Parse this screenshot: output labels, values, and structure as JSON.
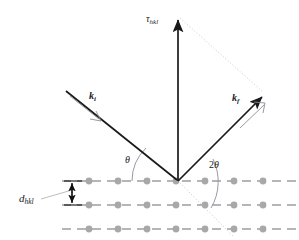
{
  "figure": {
    "kind": "bragg-diffraction-scattering-geometry",
    "background_color": "#ffffff",
    "width": 299,
    "height": 240
  },
  "colors": {
    "vector_stroke": "#1a1a1a",
    "lattice_dash": "#6b6b78",
    "atom_fill": "#a8a8a8",
    "construction_dotted": "#c9c9c9",
    "arc_stroke": "#9a9aa2",
    "label_text": "#1a1a1a",
    "open_arrowhead": "#8c8c94"
  },
  "labels": {
    "tau": {
      "symbol": "τ",
      "subscript": "hkl",
      "text": "τhkl"
    },
    "k_incident": {
      "symbol": "k",
      "subscript": "i",
      "text": "ki"
    },
    "k_final": {
      "symbol": "k",
      "subscript": "f",
      "text": "kf"
    },
    "d_spacing": {
      "symbol": "d",
      "subscript": "hkl",
      "text": "dhkl"
    },
    "angle_theta": {
      "prefix": "",
      "symbol": "θ",
      "text": "θ"
    },
    "angle_two_theta": {
      "prefix": "2",
      "symbol": "θ",
      "text": "2θ"
    }
  },
  "geometry": {
    "origin": {
      "x": 178,
      "y": 181
    },
    "tau_tip": {
      "x": 178,
      "y": 16
    },
    "k_i_start": {
      "x": 66,
      "y": 91
    },
    "k_f_tip": {
      "x": 265,
      "y": 93
    },
    "lattice_rows_y": [
      181,
      205,
      229
    ],
    "atom_spacing": 29,
    "atom_radius": 3.4,
    "atom_first_x": 89,
    "atoms_per_row": 8,
    "d_arrow_x": 72,
    "theta_arc_radius": 46,
    "two_theta_arc_radius": 52
  },
  "annotations": {
    "theta_description": "incidence angle between k-incident and lattice plane",
    "two_theta_description": "scattering angle between transmitted direction and k-final",
    "d_description": "interplanar spacing between adjacent lattice planes"
  }
}
